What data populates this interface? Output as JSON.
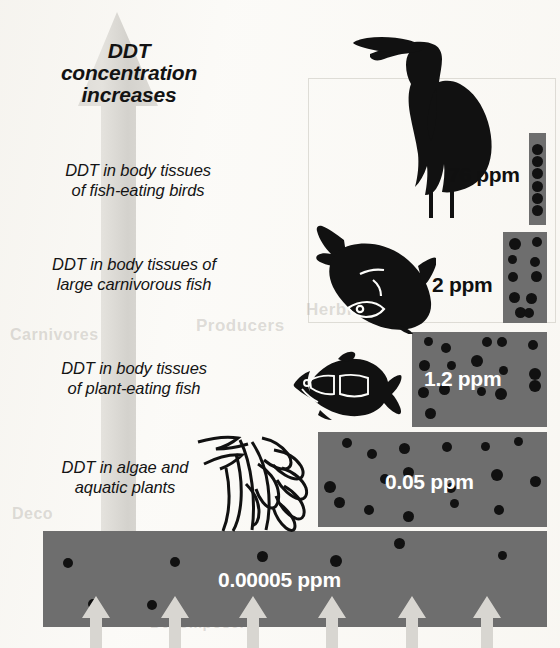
{
  "figure": {
    "title_caption": [
      "DDT",
      "concentration",
      "increases"
    ],
    "arrow_label_name": "ddt-concentration-increases-arrow"
  },
  "colors": {
    "bar_fill": "#6e6e6e",
    "dot": "#111111",
    "arrow_gray": "#d8d6d1",
    "value_text_light": "#ffffff",
    "value_text_dark": "#101010",
    "background": "#fbfaf7"
  },
  "levels": [
    {
      "id": "fish-eating-birds",
      "label": "DDT in body tissues of fish-eating birds",
      "label_lines": [
        "DDT in body tissues",
        "of fish-eating birds"
      ],
      "value": "76 ppm",
      "value_number": 76,
      "value_text_color": "dark",
      "organism_icon": "heron-silhouette",
      "bar": {
        "x": 529,
        "y": 133,
        "w": 17,
        "h": 92
      },
      "dots": 6
    },
    {
      "id": "large-carnivorous-fish",
      "label": "DDT in body tissues of large carnivorous fish",
      "label_lines": [
        "DDT in body tissues of",
        "large carnivorous fish"
      ],
      "value": "2 ppm",
      "value_number": 2,
      "value_text_color": "dark",
      "organism_icon": "large-carnivorous-fish-silhouette",
      "bar": {
        "x": 503,
        "y": 232,
        "w": 44,
        "h": 91
      },
      "dots": 10
    },
    {
      "id": "plant-eating-fish",
      "label": "DDT in body tissues of plant-eating fish",
      "label_lines": [
        "DDT in body tissues",
        "of plant-eating fish"
      ],
      "value": "1.2 ppm",
      "value_number": 1.2,
      "value_text_color": "light",
      "organism_icon": "plant-eating-fish-silhouette",
      "bar": {
        "x": 412,
        "y": 332,
        "w": 135,
        "h": 95
      },
      "dots": 16
    },
    {
      "id": "algae-and-aquatic-plants",
      "label": "DDT in algae and aquatic plants",
      "label_lines": [
        "DDT in algae and",
        "aquatic plants"
      ],
      "value": "0.05 ppm",
      "value_number": 0.05,
      "value_text_color": "light",
      "organism_icon": "algae-silhouette",
      "bar": {
        "x": 318,
        "y": 432,
        "w": 229,
        "h": 95
      },
      "dots": 17
    },
    {
      "id": "water",
      "label": "",
      "label_lines": [],
      "value": "0.00005 ppm",
      "value_number": 5e-05,
      "value_text_color": "light",
      "organism_icon": "",
      "bar": {
        "x": 43,
        "y": 531,
        "w": 504,
        "h": 96
      },
      "dots": 8
    }
  ],
  "bottom_arrows": {
    "name": "ddt-input-arrows",
    "count": 6,
    "x_centers": [
      96,
      175,
      253,
      332,
      412,
      487
    ]
  },
  "ghost_text": [
    {
      "text": "Herbivores",
      "x": 306,
      "y": 300,
      "size": 17
    },
    {
      "text": "Producers",
      "x": 196,
      "y": 316,
      "size": 17
    },
    {
      "text": "Deco",
      "x": 12,
      "y": 505,
      "size": 16
    },
    {
      "text": "Decomposers",
      "x": 150,
      "y": 614,
      "size": 15
    },
    {
      "text": "Carnivores",
      "x": 10,
      "y": 326,
      "size": 16
    }
  ]
}
